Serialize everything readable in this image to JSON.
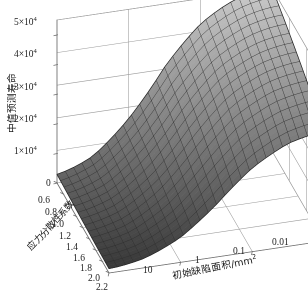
{
  "figure": {
    "kind": "3d-surface-plot",
    "background_color": "#ffffff",
    "surface_light_color": "#c8c8c8",
    "surface_dark_color": "#4a4a4a",
    "mesh_line_color": "#2b2b2b",
    "frame_line_color": "#9a9a9a",
    "text_color": "#1a1a1a"
  },
  "axes": {
    "z": {
      "title": "中值预测寿命",
      "ticks": [
        {
          "label_base": "0",
          "label_mult": "",
          "exp": "",
          "value": 0
        },
        {
          "label_base": "1",
          "label_mult": "×10",
          "exp": "4",
          "value": 10000
        },
        {
          "label_base": "2",
          "label_mult": "×10",
          "exp": "4",
          "value": 20000
        },
        {
          "label_base": "3",
          "label_mult": "×10",
          "exp": "4",
          "value": 30000
        },
        {
          "label_base": "4",
          "label_mult": "×10",
          "exp": "4",
          "value": 40000
        },
        {
          "label_base": "5",
          "label_mult": "×10",
          "exp": "4",
          "value": 50000
        }
      ],
      "range": [
        0,
        55000
      ]
    },
    "y": {
      "title": "应力分散性系数",
      "ticks": [
        "0.6",
        "0.8",
        "1.0",
        "1.2",
        "1.4",
        "1.6",
        "1.8",
        "2.0",
        "2.2"
      ],
      "values": [
        0.6,
        0.8,
        1.0,
        1.2,
        1.4,
        1.6,
        1.8,
        2.0,
        2.2
      ],
      "range": [
        0.6,
        2.2
      ]
    },
    "x": {
      "title_base": "初始缺陷面积/mm",
      "title_exp": "2",
      "ticks": [
        "10",
        "1",
        "0.1",
        "0.01"
      ],
      "values": [
        10,
        1,
        0.1,
        0.01
      ],
      "scale": "log",
      "direction": "decreasing-left-to-right"
    }
  },
  "chart_data": {
    "type": "surface",
    "title": "",
    "xlabel": "初始缺陷面积/mm2",
    "ylabel": "应力分散性系数",
    "zlabel": "中值预测寿命",
    "xlim": [
      10,
      0.01
    ],
    "ylim": [
      0.6,
      2.2
    ],
    "zlim": [
      0,
      55000
    ],
    "x": [
      10,
      3.162,
      1,
      0.3162,
      0.1,
      0.0316,
      0.01
    ],
    "y": [
      0.6,
      0.8,
      1.0,
      1.2,
      1.4,
      1.6,
      1.8,
      2.0,
      2.2
    ],
    "z_note": "z[y_index][x_index] median predicted life; rises steeply as defect area decreases and as dispersion coefficient decreases, saturating on a plateau near 5.2x10^4",
    "z": [
      [
        5200,
        12000,
        26000,
        42000,
        50000,
        52000,
        52000
      ],
      [
        4600,
        10800,
        24000,
        40000,
        49000,
        51500,
        52000
      ],
      [
        4000,
        9600,
        22000,
        38000,
        48000,
        51000,
        51800
      ],
      [
        3400,
        8400,
        20000,
        35500,
        46500,
        50000,
        51200
      ],
      [
        2800,
        7200,
        17500,
        32500,
        44500,
        49000,
        50500
      ],
      [
        2300,
        6000,
        15000,
        29000,
        42000,
        47500,
        49500
      ],
      [
        1800,
        4800,
        12500,
        25500,
        39000,
        45500,
        48000
      ],
      [
        1400,
        3800,
        10000,
        22000,
        35500,
        43000,
        46000
      ],
      [
        1000,
        2800,
        7800,
        18000,
        31500,
        40000,
        43500
      ]
    ],
    "legend": null,
    "grid": true
  }
}
